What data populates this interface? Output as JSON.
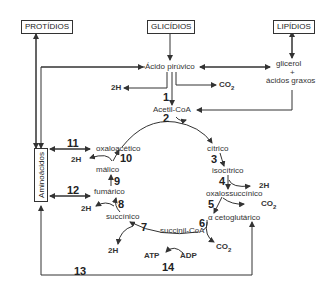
{
  "boxes": {
    "protidios": "PROTÍDIOS",
    "glicidios": "GLICÍDIOS",
    "lipidios": "LIPÍDIOS",
    "aminoacidos": "Aminoácidos"
  },
  "compounds": {
    "acido_piruvico": "Ácido pirúvico",
    "glicerol": "glicerol",
    "plus": "+",
    "acidos_graxos": "ácidos graxos",
    "acetil_coa": "Acetil-CoA",
    "citrico": "cítrico",
    "isocitrico": "isocítrico",
    "oxalossuccinico": "oxalossuccínico",
    "cetoglutarico": "α cetoglutárico",
    "succinil_coa": "succinil-CoA",
    "succinico": "succínico",
    "fumarico": "fumárico",
    "malico": "málico",
    "oxaloacetico": "oxaloacético"
  },
  "byproducts": {
    "h2_1": "2H",
    "co2_1": "CO",
    "h2_4": "2H",
    "co2_5": "CO",
    "co2_6": "CO",
    "h2_7": "2H",
    "h2_8": "2H",
    "h2_10": "2H",
    "atp": "ATP",
    "adp": "ADP",
    "sub2": "2"
  },
  "steps": [
    "1",
    "2",
    "3",
    "4",
    "5",
    "6",
    "7",
    "8",
    "9",
    "10",
    "11",
    "12",
    "13",
    "14"
  ]
}
